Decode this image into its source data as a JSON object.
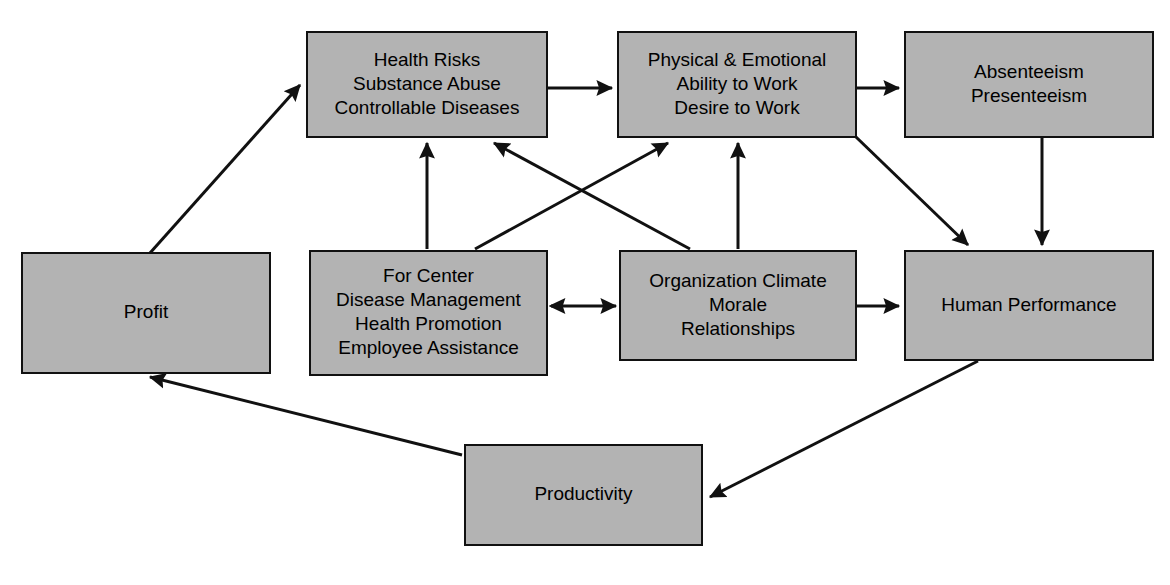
{
  "diagram": {
    "type": "flow-diagram",
    "canvas": {
      "width": 1170,
      "height": 585
    },
    "style": {
      "node_fill": "#b3b3b3",
      "node_stroke": "#111111",
      "edge_color": "#111111",
      "background": "#ffffff",
      "text_color": "#000000"
    },
    "nodes": [
      {
        "id": "profit",
        "name": "profit",
        "lines": [
          "Profit"
        ],
        "x": 22,
        "y": 253,
        "w": 248,
        "h": 120
      },
      {
        "id": "health-risks",
        "name": "health-risks",
        "lines": [
          "Health Risks",
          "Substance Abuse",
          "Controllable Diseases"
        ],
        "x": 307,
        "y": 32,
        "w": 240,
        "h": 105
      },
      {
        "id": "physical-emotional",
        "name": "physical-and-emotional",
        "lines": [
          "Physical & Emotional",
          "Ability to Work",
          "Desire to Work"
        ],
        "x": 618,
        "y": 32,
        "w": 238,
        "h": 105
      },
      {
        "id": "absenteeism",
        "name": "absenteeism-presenteeism",
        "lines": [
          "Absenteeism",
          "Presenteeism"
        ],
        "x": 905,
        "y": 32,
        "w": 248,
        "h": 105
      },
      {
        "id": "for-center",
        "name": "for-center-programs",
        "lines": [
          "For Center",
          "Disease Management",
          "Health Promotion",
          "Employee Assistance"
        ],
        "x": 310,
        "y": 251,
        "w": 237,
        "h": 124
      },
      {
        "id": "organization-climate",
        "name": "organization-climate",
        "lines": [
          "Organization Climate",
          "Morale",
          "Relationships"
        ],
        "x": 620,
        "y": 251,
        "w": 236,
        "h": 109
      },
      {
        "id": "human-performance",
        "name": "human-performance",
        "lines": [
          "Human Performance"
        ],
        "x": 905,
        "y": 251,
        "w": 248,
        "h": 109
      },
      {
        "id": "productivity",
        "name": "productivity",
        "lines": [
          "Productivity"
        ],
        "x": 465,
        "y": 445,
        "w": 237,
        "h": 100
      }
    ],
    "edges": [
      {
        "id": "e1",
        "name": "profit-to-health-risks",
        "from": "profit",
        "to": "health-risks",
        "arrow": "single",
        "x1": 150,
        "y1": 253,
        "x2": 300,
        "y2": 85
      },
      {
        "id": "e2",
        "name": "health-risks-to-physical-emotional",
        "from": "health-risks",
        "to": "physical-emotional",
        "arrow": "single",
        "x1": 547,
        "y1": 88,
        "x2": 612,
        "y2": 88
      },
      {
        "id": "e3",
        "name": "physical-emotional-to-absenteeism",
        "from": "physical-emotional",
        "to": "absenteeism",
        "arrow": "single",
        "x1": 857,
        "y1": 88,
        "x2": 899,
        "y2": 88
      },
      {
        "id": "e4",
        "name": "for-center-to-health-risks",
        "from": "for-center",
        "to": "health-risks",
        "arrow": "single",
        "x1": 427,
        "y1": 249,
        "x2": 427,
        "y2": 143
      },
      {
        "id": "e5",
        "name": "for-center-to-physical-emotional",
        "from": "for-center",
        "to": "physical-emotional",
        "arrow": "single",
        "x1": 475,
        "y1": 249,
        "x2": 668,
        "y2": 143
      },
      {
        "id": "e6",
        "name": "organization-climate-to-health-risks",
        "from": "organization-climate",
        "to": "health-risks",
        "arrow": "single",
        "x1": 690,
        "y1": 249,
        "x2": 494,
        "y2": 143
      },
      {
        "id": "e7",
        "name": "organization-climate-to-physical-emotional",
        "from": "organization-climate",
        "to": "physical-emotional",
        "arrow": "single",
        "x1": 738,
        "y1": 249,
        "x2": 738,
        "y2": 143
      },
      {
        "id": "e8",
        "name": "for-center-and-organization-climate",
        "from": "for-center",
        "to": "organization-climate",
        "arrow": "double",
        "x1": 551,
        "y1": 306,
        "x2": 616,
        "y2": 306
      },
      {
        "id": "e9",
        "name": "organization-climate-to-human-performance",
        "from": "organization-climate",
        "to": "human-performance",
        "arrow": "single",
        "x1": 857,
        "y1": 306,
        "x2": 899,
        "y2": 306
      },
      {
        "id": "e10",
        "name": "physical-emotional-to-human-performance",
        "from": "physical-emotional",
        "to": "human-performance",
        "arrow": "single",
        "x1": 856,
        "y1": 137,
        "x2": 968,
        "y2": 245
      },
      {
        "id": "e11",
        "name": "absenteeism-to-human-performance",
        "from": "absenteeism",
        "to": "human-performance",
        "arrow": "single",
        "x1": 1042,
        "y1": 138,
        "x2": 1042,
        "y2": 245
      },
      {
        "id": "e12",
        "name": "human-performance-to-productivity",
        "from": "human-performance",
        "to": "productivity",
        "arrow": "single",
        "x1": 978,
        "y1": 361,
        "x2": 710,
        "y2": 497
      },
      {
        "id": "e13",
        "name": "productivity-to-profit",
        "from": "productivity",
        "to": "profit",
        "arrow": "single",
        "x1": 462,
        "y1": 455,
        "x2": 150,
        "y2": 377
      }
    ]
  }
}
